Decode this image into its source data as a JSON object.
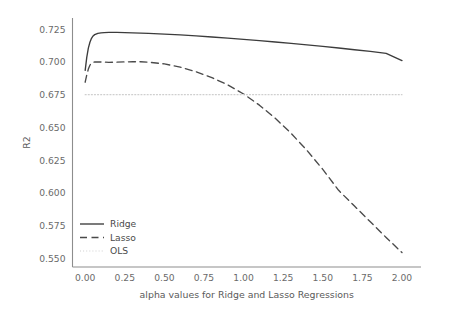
{
  "chart_data": {
    "type": "line",
    "title": "",
    "xlabel": "alpha values for Ridge and Lasso Regressions",
    "ylabel": "R2",
    "xlim": [
      -0.08,
      2.12
    ],
    "ylim": [
      0.5435,
      0.7335
    ],
    "grid": false,
    "legend_position": "lower left",
    "xticks": [
      "0.00",
      "0.25",
      "0.50",
      "0.75",
      "1.00",
      "1.25",
      "1.50",
      "1.75",
      "2.00"
    ],
    "xtick_values": [
      0.0,
      0.25,
      0.5,
      0.75,
      1.0,
      1.25,
      1.5,
      1.75,
      2.0
    ],
    "yticks": [
      "0.550",
      "0.575",
      "0.600",
      "0.625",
      "0.650",
      "0.675",
      "0.700",
      "0.725"
    ],
    "ytick_values": [
      0.55,
      0.575,
      0.6,
      0.625,
      0.65,
      0.675,
      0.7,
      0.725
    ],
    "x": [
      0.0,
      0.01,
      0.02,
      0.03,
      0.04,
      0.05,
      0.06,
      0.08,
      0.1,
      0.12,
      0.15,
      0.2,
      0.25,
      0.3,
      0.35,
      0.4,
      0.5,
      0.6,
      0.7,
      0.8,
      0.9,
      1.0,
      1.1,
      1.2,
      1.3,
      1.4,
      1.5,
      1.6,
      1.7,
      1.8,
      1.9,
      2.0
    ],
    "series": [
      {
        "name": "Ridge",
        "style": "solid",
        "color": "#3c3c3c",
        "values": [
          0.6935,
          0.7035,
          0.7105,
          0.715,
          0.718,
          0.7198,
          0.7208,
          0.7218,
          0.7222,
          0.7224,
          0.7225,
          0.7225,
          0.7224,
          0.7222,
          0.722,
          0.7218,
          0.7212,
          0.7206,
          0.7198,
          0.719,
          0.7181,
          0.7172,
          0.7162,
          0.7152,
          0.7141,
          0.713,
          0.7118,
          0.7106,
          0.7093,
          0.708,
          0.7065,
          0.701
        ]
      },
      {
        "name": "Lasso",
        "style": "dashed",
        "color": "#4a4a4a",
        "values": [
          0.6845,
          0.69,
          0.6945,
          0.6975,
          0.699,
          0.6997,
          0.6999,
          0.7,
          0.6999,
          0.6998,
          0.6997,
          0.6998,
          0.7,
          0.7001,
          0.7001,
          0.6998,
          0.6985,
          0.696,
          0.6925,
          0.688,
          0.6825,
          0.6755,
          0.667,
          0.657,
          0.6455,
          0.6325,
          0.618,
          0.602,
          0.59,
          0.578,
          0.566,
          0.5545
        ]
      },
      {
        "name": "OLS",
        "style": "dotted",
        "color": "#cfcfcf",
        "constant": 0.675,
        "values": [
          0.675,
          0.675,
          0.675,
          0.675,
          0.675,
          0.675,
          0.675,
          0.675,
          0.675,
          0.675,
          0.675,
          0.675,
          0.675,
          0.675,
          0.675,
          0.675,
          0.675,
          0.675,
          0.675,
          0.675,
          0.675,
          0.675,
          0.675,
          0.675,
          0.675,
          0.675,
          0.675,
          0.675,
          0.675,
          0.675,
          0.675,
          0.675
        ]
      }
    ],
    "legend": [
      {
        "label": "Ridge",
        "style": "solid",
        "color": "#3c3c3c"
      },
      {
        "label": "Lasso",
        "style": "dashed",
        "color": "#4a4a4a"
      },
      {
        "label": "OLS",
        "style": "dotted",
        "color": "#cfcfcf"
      }
    ]
  },
  "colors": {
    "background": "#ffffff",
    "spine": "#8d8d8d",
    "tick_text": "#6b6b6b",
    "axis_title": "#5a5a5a",
    "ridge": "#3c3c3c",
    "lasso": "#4a4a4a",
    "ols": "#cfcfcf"
  }
}
